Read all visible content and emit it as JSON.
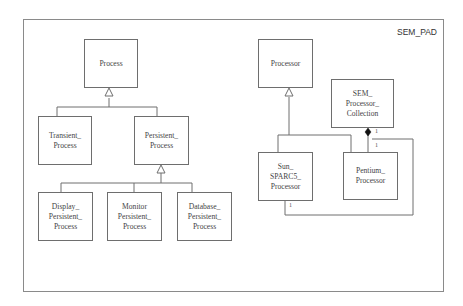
{
  "package": {
    "name": "SEM_PAD"
  },
  "classes": {
    "process": {
      "lines": [
        "Process"
      ]
    },
    "transient_process": {
      "lines": [
        "Transient_",
        "Process"
      ]
    },
    "persistent_process": {
      "lines": [
        "Persistent_",
        "Process"
      ]
    },
    "display_persistent_process": {
      "lines": [
        "Display_",
        "Persistent_",
        "Process"
      ]
    },
    "monitor_persistent_process": {
      "lines": [
        "Monitor",
        "Persistent_",
        "Process"
      ]
    },
    "database_persistent_process": {
      "lines": [
        "Database_",
        "Persistent_",
        "Process"
      ]
    },
    "processor": {
      "lines": [
        "Processor"
      ]
    },
    "sem_processor_collection": {
      "lines": [
        "SEM_",
        "Processor_",
        "Collection"
      ]
    },
    "sun_sparc5_processor": {
      "lines": [
        "Sun_",
        "SPARC5_",
        "Processor"
      ]
    },
    "pentium_processor": {
      "lines": [
        "Pentium_",
        "Processor"
      ]
    }
  },
  "relationships": {
    "generalizations": [
      {
        "parent": "Process",
        "children": [
          "Transient_Process",
          "Persistent_Process"
        ]
      },
      {
        "parent": "Persistent_Process",
        "children": [
          "Display_Persistent_Process",
          "Monitor Persistent_Process",
          "Database_Persistent_Process"
        ]
      },
      {
        "parent": "Processor",
        "children": [
          "Sun_SPARC5_Processor",
          "Pentium_Processor"
        ]
      }
    ],
    "compositions": [
      {
        "whole": "SEM_Processor_Collection",
        "part": "Pentium_Processor",
        "whole_multiplicity": "1",
        "part_multiplicity": "1"
      },
      {
        "whole": "SEM_Processor_Collection",
        "part": "Sun_SPARC5_Processor",
        "whole_multiplicity": "1",
        "part_multiplicity": "1"
      }
    ],
    "multiplicities": {
      "collection_diamond": "1",
      "pentium_top": "1",
      "sun_bottom": "1"
    }
  },
  "colors": {
    "line": "#6e6e6e",
    "frame": "#8a8a8a",
    "text": "#444444"
  }
}
